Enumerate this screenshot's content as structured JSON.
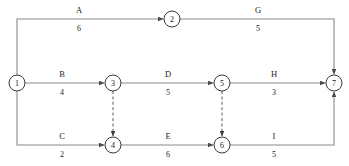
{
  "diagram": {
    "kind": "activity-on-arrow-network-diagram",
    "colors": {
      "background": "#ffffff",
      "line": "#8a8a8a",
      "dummy_line": "#6b6b6b",
      "node_stroke": "#3a3a3a",
      "text": "#222222"
    },
    "nodes": [
      {
        "id": "1",
        "label": "1",
        "cx": 17,
        "cy": 83,
        "r": 8
      },
      {
        "id": "2",
        "label": "2",
        "cx": 172,
        "cy": 19,
        "r": 8
      },
      {
        "id": "3",
        "label": "3",
        "cx": 113,
        "cy": 83,
        "r": 8
      },
      {
        "id": "4",
        "label": "4",
        "cx": 113,
        "cy": 145,
        "r": 8
      },
      {
        "id": "5",
        "label": "5",
        "cx": 222,
        "cy": 83,
        "r": 8
      },
      {
        "id": "6",
        "label": "6",
        "cx": 222,
        "cy": 145,
        "r": 8
      },
      {
        "id": "7",
        "label": "7",
        "cx": 334,
        "cy": 83,
        "r": 8
      }
    ],
    "edges": [
      {
        "id": "A",
        "label": "A",
        "duration": "6",
        "from": "1",
        "to": "2",
        "label_x": 79,
        "label_y": 13,
        "dur_x": 79,
        "dur_y": 31
      },
      {
        "id": "G",
        "label": "G",
        "duration": "5",
        "from": "2",
        "to": "7",
        "label_x": 258,
        "label_y": 13,
        "dur_x": 258,
        "dur_y": 31
      },
      {
        "id": "B",
        "label": "B",
        "duration": "4",
        "from": "1",
        "to": "3",
        "label_x": 62,
        "label_y": 77,
        "dur_x": 62,
        "dur_y": 95
      },
      {
        "id": "D",
        "label": "D",
        "duration": "5",
        "from": "3",
        "to": "5",
        "label_x": 168,
        "label_y": 77,
        "dur_x": 168,
        "dur_y": 95
      },
      {
        "id": "H",
        "label": "H",
        "duration": "3",
        "from": "5",
        "to": "7",
        "label_x": 274,
        "label_y": 77,
        "dur_x": 274,
        "dur_y": 95
      },
      {
        "id": "C",
        "label": "C",
        "duration": "2",
        "from": "1",
        "to": "4",
        "label_x": 62,
        "label_y": 139,
        "dur_x": 62,
        "dur_y": 157
      },
      {
        "id": "E",
        "label": "E",
        "duration": "6",
        "from": "4",
        "to": "6",
        "label_x": 168,
        "label_y": 139,
        "dur_x": 168,
        "dur_y": 157
      },
      {
        "id": "I",
        "label": "I",
        "duration": "5",
        "from": "6",
        "to": "7",
        "label_x": 274,
        "label_y": 139,
        "dur_x": 274,
        "dur_y": 157
      }
    ],
    "dummy_edges": [
      {
        "id": "dummy-3-4",
        "from": "3",
        "to": "4"
      },
      {
        "id": "dummy-5-6",
        "from": "5",
        "to": "6"
      }
    ]
  }
}
